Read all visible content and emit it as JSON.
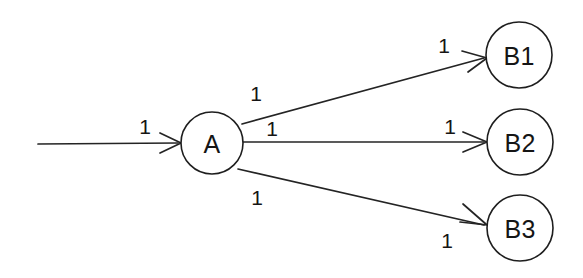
{
  "diagram": {
    "type": "directed-flow-graph",
    "background_color": "#ffffff",
    "stroke_color": "#242424",
    "text_color": "#151515",
    "nodes": [
      {
        "id": "A",
        "label": "A",
        "cx": 212,
        "cy": 143,
        "r": 31
      },
      {
        "id": "B1",
        "label": "B1",
        "cx": 519,
        "cy": 55,
        "r": 33
      },
      {
        "id": "B2",
        "label": "B2",
        "cx": 520,
        "cy": 142,
        "r": 33
      },
      {
        "id": "B3",
        "label": "B3",
        "cx": 520,
        "cy": 228,
        "r": 33
      }
    ],
    "edges": [
      {
        "id": "source-to-A",
        "from": "source",
        "to": "A",
        "x1": 38,
        "y1": 144,
        "x2": 181,
        "y2": 143,
        "labels": [
          {
            "text": "1",
            "x": 145,
            "y": 126
          }
        ]
      },
      {
        "id": "A-to-B1",
        "from": "A",
        "to": "B1",
        "x1": 242,
        "y1": 124,
        "x2": 487,
        "y2": 58,
        "labels": [
          {
            "text": "1",
            "x": 256,
            "y": 93
          },
          {
            "text": "1",
            "x": 444,
            "y": 45
          }
        ]
      },
      {
        "id": "A-to-B2",
        "from": "A",
        "to": "B2",
        "x1": 243,
        "y1": 142,
        "x2": 487,
        "y2": 142,
        "labels": [
          {
            "text": "1",
            "x": 272,
            "y": 128
          },
          {
            "text": "1",
            "x": 450,
            "y": 126
          }
        ]
      },
      {
        "id": "A-to-B3",
        "from": "A",
        "to": "B3",
        "x1": 238,
        "y1": 169,
        "x2": 487,
        "y2": 225,
        "labels": [
          {
            "text": "1",
            "x": 257,
            "y": 197
          },
          {
            "text": "1",
            "x": 447,
            "y": 240
          }
        ]
      }
    ]
  }
}
